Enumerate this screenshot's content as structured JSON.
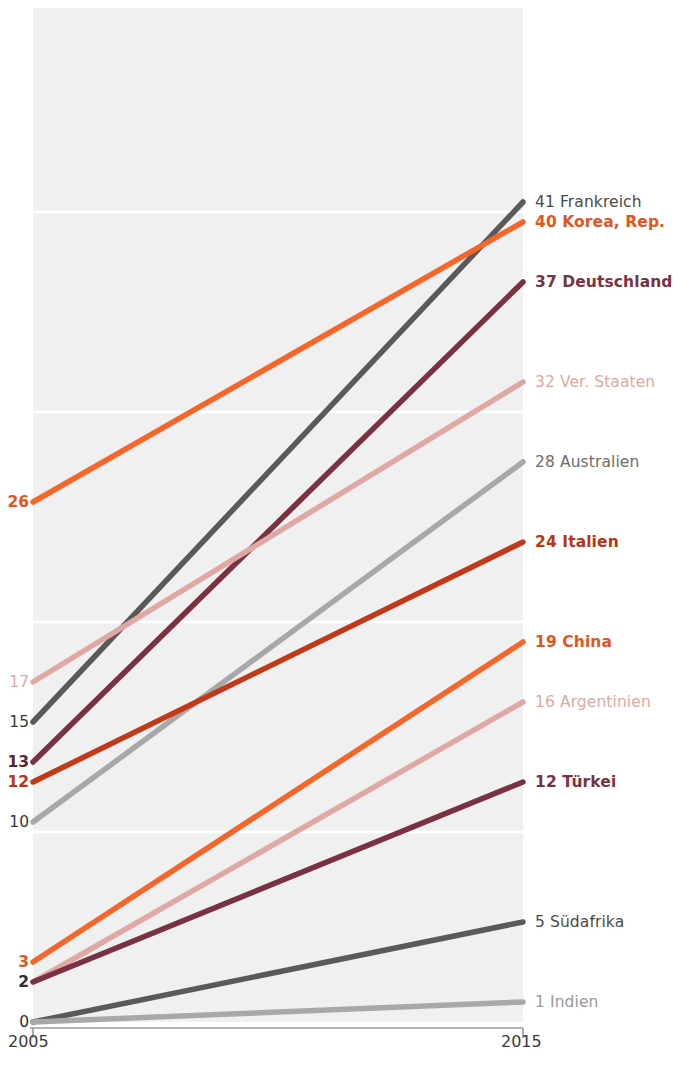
{
  "chart": {
    "type": "slope",
    "x_axis": {
      "left_tick_label": "2005",
      "right_tick_label": "2015",
      "left_value": 2005,
      "right_value": 2015
    },
    "geometry": {
      "plot_left_px": 33,
      "plot_right_px": 523,
      "plot_top_px": 8,
      "baseline_px": 1022,
      "px_per_unit": 20.0,
      "label_gap_px": 12
    },
    "gridlines_px": [
      212,
      412,
      622,
      832
    ],
    "plot_background": "#f0f0f0",
    "axis_color": "#9a9a9a"
  },
  "chart_data": {
    "type": "line",
    "title": "",
    "subtitle": "",
    "xlabel": "",
    "ylabel": "",
    "x": [
      2005,
      2015
    ],
    "xtick_labels": [
      "2005",
      "2015"
    ],
    "ylim": [
      0,
      42
    ],
    "grid": true,
    "legend_position": "right-inline",
    "series": [
      {
        "name": "Frankreich",
        "start_value": 15,
        "end_value": 41,
        "start_label": "15",
        "end_label": "41 Frankreich",
        "color": "#5a5a5a",
        "start_label_color": "#3a3a3a",
        "end_label_color": "#4a4a4a",
        "bold": false,
        "width": 5.5
      },
      {
        "name": "Korea, Rep.",
        "start_value": 26,
        "end_value": 40,
        "start_label": "26",
        "end_label": "40 Korea, Rep.",
        "color": "#f4662a",
        "start_label_color": "#e3551c",
        "end_label_color": "#e3551c",
        "bold": true,
        "width": 5.5
      },
      {
        "name": "Deutschland",
        "start_value": 13,
        "end_value": 37,
        "start_label": "13",
        "end_label": "37 Deutschland",
        "color": "#7a3242",
        "start_label_color": "#5e2430",
        "end_label_color": "#7a3242",
        "bold": true,
        "width": 5.5
      },
      {
        "name": "Ver. Staaten",
        "start_value": 17,
        "end_value": 32,
        "start_label": "17",
        "end_label": "32 Ver. Staaten",
        "color": "#e0a8a4",
        "start_label_color": "#ddaaa6",
        "end_label_color": "#ddaaa6",
        "bold": false,
        "width": 5.5
      },
      {
        "name": "Australien",
        "start_value": 10,
        "end_value": 28,
        "start_label": "10",
        "end_label": "28 Australien",
        "color": "#a8a8a8",
        "start_label_color": "#3a3a3a",
        "end_label_color": "#6e6e6e",
        "bold": false,
        "width": 5.5
      },
      {
        "name": "Italien",
        "start_value": 12,
        "end_value": 24,
        "start_label": "12",
        "end_label": "24 Italien",
        "color": "#c03a1a",
        "start_label_color": "#b83515",
        "end_label_color": "#b83515",
        "bold": true,
        "width": 5.5
      },
      {
        "name": "China",
        "start_value": 3,
        "end_value": 19,
        "start_label": "3",
        "end_label": "19 China",
        "color": "#f4662a",
        "start_label_color": "#e3551c",
        "end_label_color": "#e3551c",
        "bold": true,
        "width": 5.5
      },
      {
        "name": "Argentinien",
        "start_value": 2,
        "end_value": 16,
        "start_label": "",
        "end_label": "16 Argentinien",
        "color": "#e0a8a4",
        "start_label_color": "#ddaaa6",
        "end_label_color": "#ddaaa6",
        "bold": false,
        "width": 5.5
      },
      {
        "name": "Türkei",
        "start_value": 2,
        "end_value": 12,
        "start_label": "2",
        "end_label": "12 Türkei",
        "color": "#7a3242",
        "start_label_color": "#2e2e2e",
        "end_label_color": "#7a3242",
        "bold": true,
        "width": 5.5
      },
      {
        "name": "Südafrika",
        "start_value": 0,
        "end_value": 5,
        "start_label": "",
        "end_label": "5 Südafrika",
        "color": "#5a5a5a",
        "start_label_color": "#3a3a3a",
        "end_label_color": "#4a4a4a",
        "bold": false,
        "width": 5.5
      },
      {
        "name": "Indien",
        "start_value": 0,
        "end_value": 1,
        "start_label": "0",
        "end_label": "1 Indien",
        "color": "#a8a8a8",
        "start_label_color": "#2e2e2e",
        "end_label_color": "#9a9a9a",
        "bold": false,
        "width": 5.5
      }
    ]
  }
}
